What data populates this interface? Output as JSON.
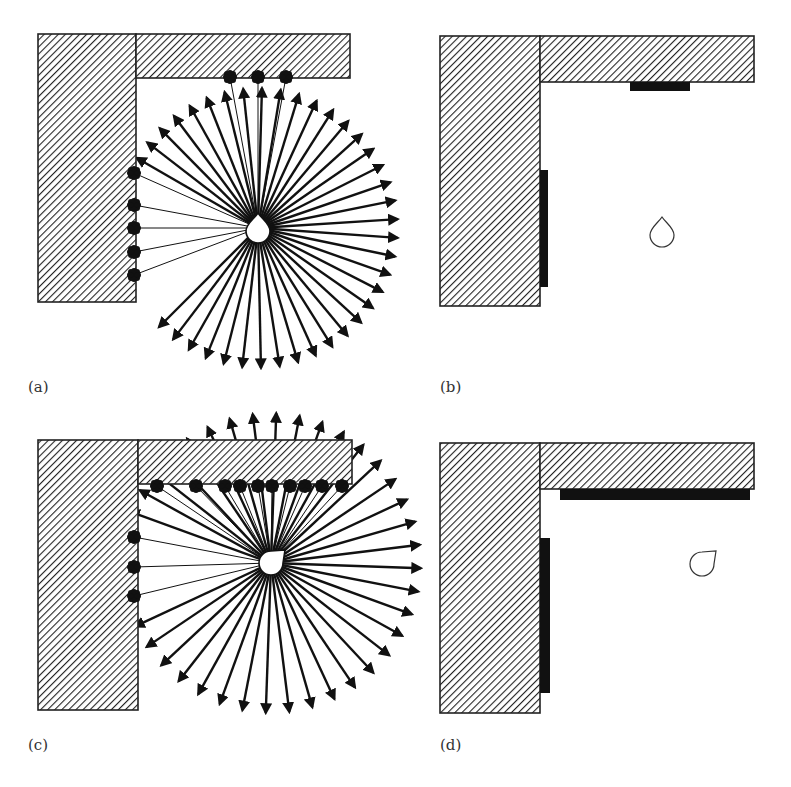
{
  "figure": {
    "panels": [
      {
        "id": "a",
        "label": "(a)",
        "label_pos": [
          28,
          392
        ],
        "walls": [
          [
            38,
            34,
            98,
            268
          ],
          [
            136,
            34,
            214,
            44
          ]
        ],
        "source": {
          "x": 258,
          "y": 228,
          "shape": "drop-up"
        },
        "ray_angles_start": -150,
        "ray_angles_end": 135,
        "ray_count": 38,
        "ray_length": 140,
        "hit_points": [
          [
            230,
            77
          ],
          [
            258,
            77
          ],
          [
            286,
            77
          ],
          [
            134,
            173
          ],
          [
            134,
            205
          ],
          [
            134,
            228
          ],
          [
            134,
            252
          ],
          [
            134,
            275
          ]
        ]
      },
      {
        "id": "b",
        "label": "(b)",
        "label_pos": [
          440,
          392
        ],
        "walls": [
          [
            440,
            36,
            100,
            270
          ],
          [
            540,
            36,
            214,
            46
          ]
        ],
        "absorbers": [
          [
            630,
            82,
            60,
            9
          ],
          [
            540,
            170,
            8,
            117
          ]
        ],
        "source": {
          "x": 662,
          "y": 232,
          "shape": "drop-up"
        }
      },
      {
        "id": "c",
        "label": "(c)",
        "label_pos": [
          28,
          750
        ],
        "walls": [
          [
            38,
            440,
            100,
            270
          ],
          [
            138,
            440,
            214,
            44
          ]
        ],
        "source": {
          "x": 271,
          "y": 563,
          "shape": "drop-up-right"
        },
        "ray_angles_start": -160,
        "ray_angles_end": 155,
        "ray_count": 36,
        "ray_length": 150,
        "hit_points": [
          [
            157,
            486
          ],
          [
            196,
            486
          ],
          [
            225,
            486
          ],
          [
            240,
            486
          ],
          [
            258,
            486
          ],
          [
            272,
            486
          ],
          [
            290,
            486
          ],
          [
            305,
            486
          ],
          [
            322,
            486
          ],
          [
            342,
            486
          ],
          [
            134,
            537
          ],
          [
            134,
            567
          ],
          [
            134,
            596
          ]
        ]
      },
      {
        "id": "d",
        "label": "(d)",
        "label_pos": [
          440,
          750
        ],
        "walls": [
          [
            440,
            443,
            100,
            270
          ],
          [
            540,
            443,
            214,
            46
          ]
        ],
        "absorbers": [
          [
            560,
            489,
            190,
            11
          ],
          [
            540,
            538,
            10,
            155
          ]
        ],
        "source": {
          "x": 702,
          "y": 564,
          "shape": "drop-up-right"
        }
      }
    ]
  }
}
